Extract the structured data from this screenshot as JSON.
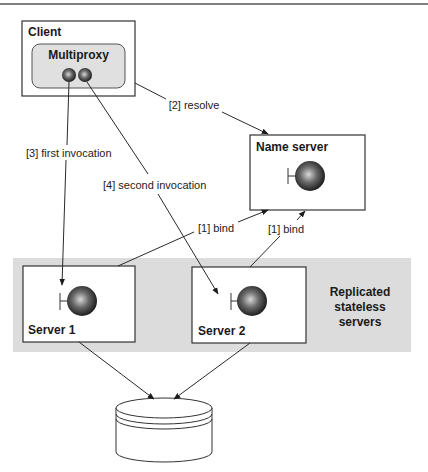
{
  "diagram": {
    "colors": {
      "band": "#dcdcdc",
      "proxy_fill": "#e0e0e0",
      "line": "#2a2a2a",
      "object_dark": "#111111",
      "object_light": "#d8d8d8"
    },
    "nodes": {
      "client": {
        "label": "Client"
      },
      "multiproxy": {
        "label": "Multiproxy"
      },
      "name_server": {
        "label": "Name server"
      },
      "server1": {
        "label": "Server 1"
      },
      "server2": {
        "label": "Server 2"
      },
      "replicated_group": {
        "label_lines": [
          "Replicated",
          "stateless",
          "servers"
        ]
      },
      "database": {
        "label": ""
      }
    },
    "edges": [
      {
        "id": "resolve",
        "from": "client",
        "to": "name_server",
        "label": "[2] resolve"
      },
      {
        "id": "first_invocation",
        "from": "multiproxy",
        "to": "server1",
        "label": "[3] first invocation"
      },
      {
        "id": "second_invocation",
        "from": "multiproxy",
        "to": "server2",
        "label": "[4] second invocation"
      },
      {
        "id": "bind1",
        "from": "server1",
        "to": "name_server",
        "label": "[1] bind"
      },
      {
        "id": "bind2",
        "from": "server2",
        "to": "name_server",
        "label": "[1] bind"
      },
      {
        "id": "db1",
        "from": "server1",
        "to": "database",
        "label": ""
      },
      {
        "id": "db2",
        "from": "server2",
        "to": "database",
        "label": ""
      }
    ]
  }
}
